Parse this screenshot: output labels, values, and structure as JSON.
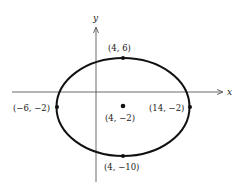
{
  "diagram": {
    "type": "ellipse-graph",
    "axes": {
      "x_label": "x",
      "y_label": "y"
    },
    "ellipse": {
      "center": [
        4,
        -2
      ],
      "a": 10,
      "b": 8
    },
    "points": {
      "top": {
        "label": "(4, 6)"
      },
      "bottom": {
        "label": "(4, −10)"
      },
      "left": {
        "label": "(−6, −2)"
      },
      "right": {
        "label": "(14, −2)"
      },
      "center": {
        "label": "(4, −2)"
      }
    },
    "colors": {
      "stroke": "#111111",
      "axis": "#444444",
      "background": "#ffffff"
    }
  }
}
